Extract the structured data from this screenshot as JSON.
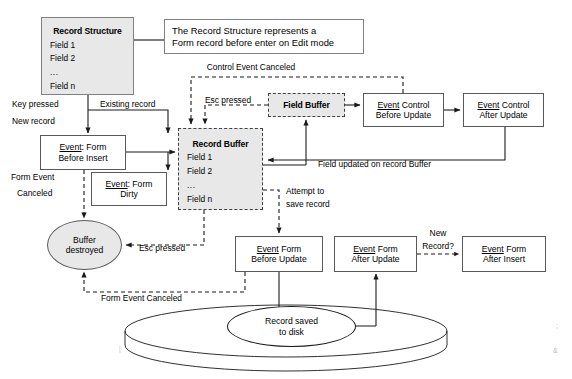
{
  "diagram": {
    "colors": {
      "shaded_fill": "#e8e8e8",
      "stroke": "#595959",
      "dashed_stroke": "#404040",
      "text": "#000000"
    },
    "nodes": {
      "record_structure": {
        "title": "Record Structure",
        "fields": [
          "Field 1",
          "Field 2",
          "...",
          "Field n"
        ]
      },
      "annotation": {
        "line1": "The Record Structure represents a",
        "line2": "Form record before enter on Edit mode"
      },
      "field_buffer": {
        "title": "Field Buffer"
      },
      "record_buffer": {
        "title": "Record Buffer",
        "fields": [
          "Field 1",
          "Field 2",
          "...",
          "Field n"
        ]
      },
      "event_control_before_update": {
        "line1_underlined": "Event",
        "line1_rest": " Control",
        "line2": "Before Update"
      },
      "event_control_after_update": {
        "line1_underlined": "Event",
        "line1_rest": " Control",
        "line2": "After Update"
      },
      "event_form_before_insert": {
        "line1_underlined": "Event",
        "line1_rest": ": Form",
        "line2": "Before Insert"
      },
      "event_form_dirty": {
        "line1_underlined": "Event",
        "line1_rest": ": Form",
        "line2": "Dirty"
      },
      "buffer_destroyed": {
        "line1": "Buffer",
        "line2": "destroyed"
      },
      "event_form_before_update": {
        "line1_underlined": "Event",
        "line1_rest": " Form",
        "line2": "Before Update"
      },
      "event_form_after_update": {
        "line1_underlined": "Event",
        "line1_rest": " Form",
        "line2": "After Update"
      },
      "event_form_after_insert": {
        "line1_underlined": "Event",
        "line1_rest": " Form",
        "line2": "After Insert"
      },
      "record_saved": {
        "line1": "Record saved",
        "line2": "to disk"
      }
    },
    "edge_labels": {
      "key_pressed": "Key pressed",
      "new_record": "New record",
      "existing_record": "Existing record",
      "control_event_canceled": "Control Event Canceled",
      "esc_pressed_top": "Esc pressed",
      "field_updated": "Field updated on record Buffer",
      "form_event_canceled_left": "Form Event",
      "form_event_canceled_left2": "Canceled",
      "esc_pressed_mid": "Esc pressed",
      "attempt_to_save1": "Attempt to",
      "attempt_to_save2": "save record",
      "new_record_q1": "New",
      "new_record_q2": "Record?",
      "form_event_canceled_bottom": "Form Event Canceled"
    }
  }
}
